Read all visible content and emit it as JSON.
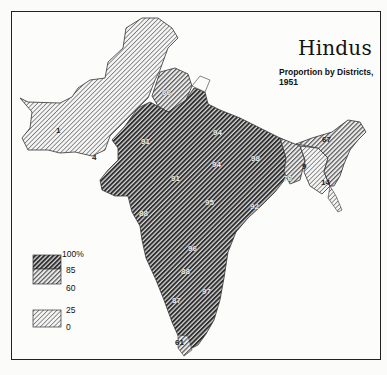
{
  "map": {
    "title": "Hindus",
    "subtitle": "Proportion by Districts, 1951",
    "region": "Indian subcontinent (India, Pakistan, East Pakistan)",
    "legend": {
      "bins": [
        {
          "range": "85–100%",
          "pattern": "dense dark diagonal hatch",
          "color": "#3a3a3a"
        },
        {
          "range": "60–85%",
          "pattern": "medium diagonal hatch",
          "color": "#8a8a8a"
        },
        {
          "range": "25–60%",
          "pattern": "none (white)",
          "color": "#fcfcfa"
        },
        {
          "range": "0–25%",
          "pattern": "light diagonal hatch",
          "color": "#c4c4c4"
        }
      ],
      "ticks": [
        "100%",
        "85",
        "60",
        "25",
        "0"
      ]
    },
    "district_labels": [
      {
        "value": "1",
        "area": "Baluchistan"
      },
      {
        "value": "4",
        "area": "Sind west"
      },
      {
        "value": "66",
        "area": "East Punjab"
      },
      {
        "value": "91",
        "area": "Rajasthan"
      },
      {
        "value": "91",
        "area": "Central Rajasthan"
      },
      {
        "value": "88",
        "area": "Gujarat / Bombay"
      },
      {
        "value": "94",
        "area": "Uttar Pradesh"
      },
      {
        "value": "94",
        "area": "Central UP"
      },
      {
        "value": "95",
        "area": "Madhya Pradesh"
      },
      {
        "value": "92",
        "area": "Eastern MP"
      },
      {
        "value": "96",
        "area": "Hyderabad/Deccan"
      },
      {
        "value": "98",
        "area": "Bihar"
      },
      {
        "value": "76",
        "area": "West Bengal"
      },
      {
        "value": "9",
        "area": "East Pakistan"
      },
      {
        "value": "67",
        "area": "Assam"
      },
      {
        "value": "14",
        "area": "Chittagong"
      },
      {
        "value": "88",
        "area": "Hyderabad"
      },
      {
        "value": "97",
        "area": "Madras"
      },
      {
        "value": "87",
        "area": "Mysore"
      },
      {
        "value": "61",
        "area": "Travancore-Cochin"
      }
    ]
  }
}
